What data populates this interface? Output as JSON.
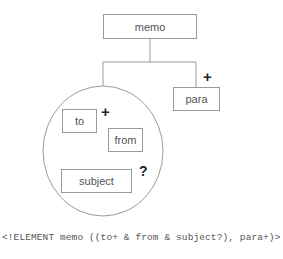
{
  "diagram": {
    "root": {
      "label": "memo"
    },
    "group": {
      "type": "unordered-and-group",
      "children": [
        {
          "label": "to",
          "occurrence": "+"
        },
        {
          "label": "from",
          "occurrence": ""
        },
        {
          "label": "subject",
          "occurrence": "?"
        }
      ]
    },
    "para": {
      "label": "para",
      "occurrence": "+"
    }
  },
  "labels": {
    "memo": "memo",
    "to": "to",
    "from": "from",
    "subject": "subject",
    "para": "para",
    "to_occurrence": "+",
    "subject_occurrence": "?",
    "para_occurrence": "+"
  },
  "dtd_declaration": "<!ELEMENT memo ((to+ & from & subject?), para+)>",
  "colors": {
    "line": "#9a9a9a",
    "text": "#555555",
    "marker": "#222222"
  }
}
